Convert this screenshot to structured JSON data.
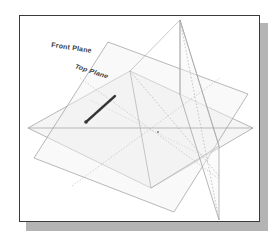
{
  "figure": {
    "type": "cad-reference-planes-diagram",
    "labels": {
      "front_plane": "Front Plane",
      "top_plane": "Top Plane"
    },
    "colors": {
      "background": "#ffffff",
      "frame_border": "#3a3a3a",
      "frame_shadow": "#b4b4b4",
      "plane_outline": "#9a9a9a",
      "plane_fill": "#ededed",
      "hidden_line": "#b0b0b0",
      "label_text": "#3c3c3c",
      "highlight_edge": "#4a4a4a"
    },
    "planes": [
      {
        "name": "front-plane",
        "label": "Front Plane",
        "orientation": "tilted-parallelogram",
        "points": "14,142 88,26 228,78 154,196"
      },
      {
        "name": "top-plane",
        "label": "Top Plane",
        "orientation": "horizontal-receding",
        "points": "8,112 110,55 233,112 131,172"
      },
      {
        "name": "right-plane",
        "label": "",
        "orientation": "vertical",
        "points": "160,4 199,130 199,204 160,79"
      }
    ],
    "highlight": {
      "name": "selected-edge",
      "from": "68,104",
      "to": "93,83"
    },
    "intersection_point": "138,116"
  }
}
